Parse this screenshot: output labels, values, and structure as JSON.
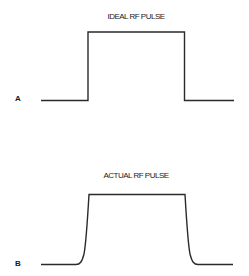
{
  "panels": [
    {
      "id": "A",
      "label": "A",
      "title": "IDEAL RF PULSE",
      "shape": "rectangular",
      "baseline_y": 100.5,
      "top_y": 32,
      "x_start": 41,
      "rise_x": 88,
      "fall_x": 184.5,
      "x_end": 234
    },
    {
      "id": "B",
      "label": "B",
      "title": "ACTUAL RF PULSE",
      "shape": "rounded-edges",
      "baseline_y": 264.5,
      "top_y": 194.5,
      "x_start": 41,
      "rise_start_x": 77,
      "rise_top_x": 89,
      "fall_top_x": 185,
      "fall_end_x": 197,
      "x_end": 233
    }
  ],
  "colors": {
    "line": "#2a2a2a",
    "text": "#1a1a1a",
    "background": "#ffffff"
  }
}
